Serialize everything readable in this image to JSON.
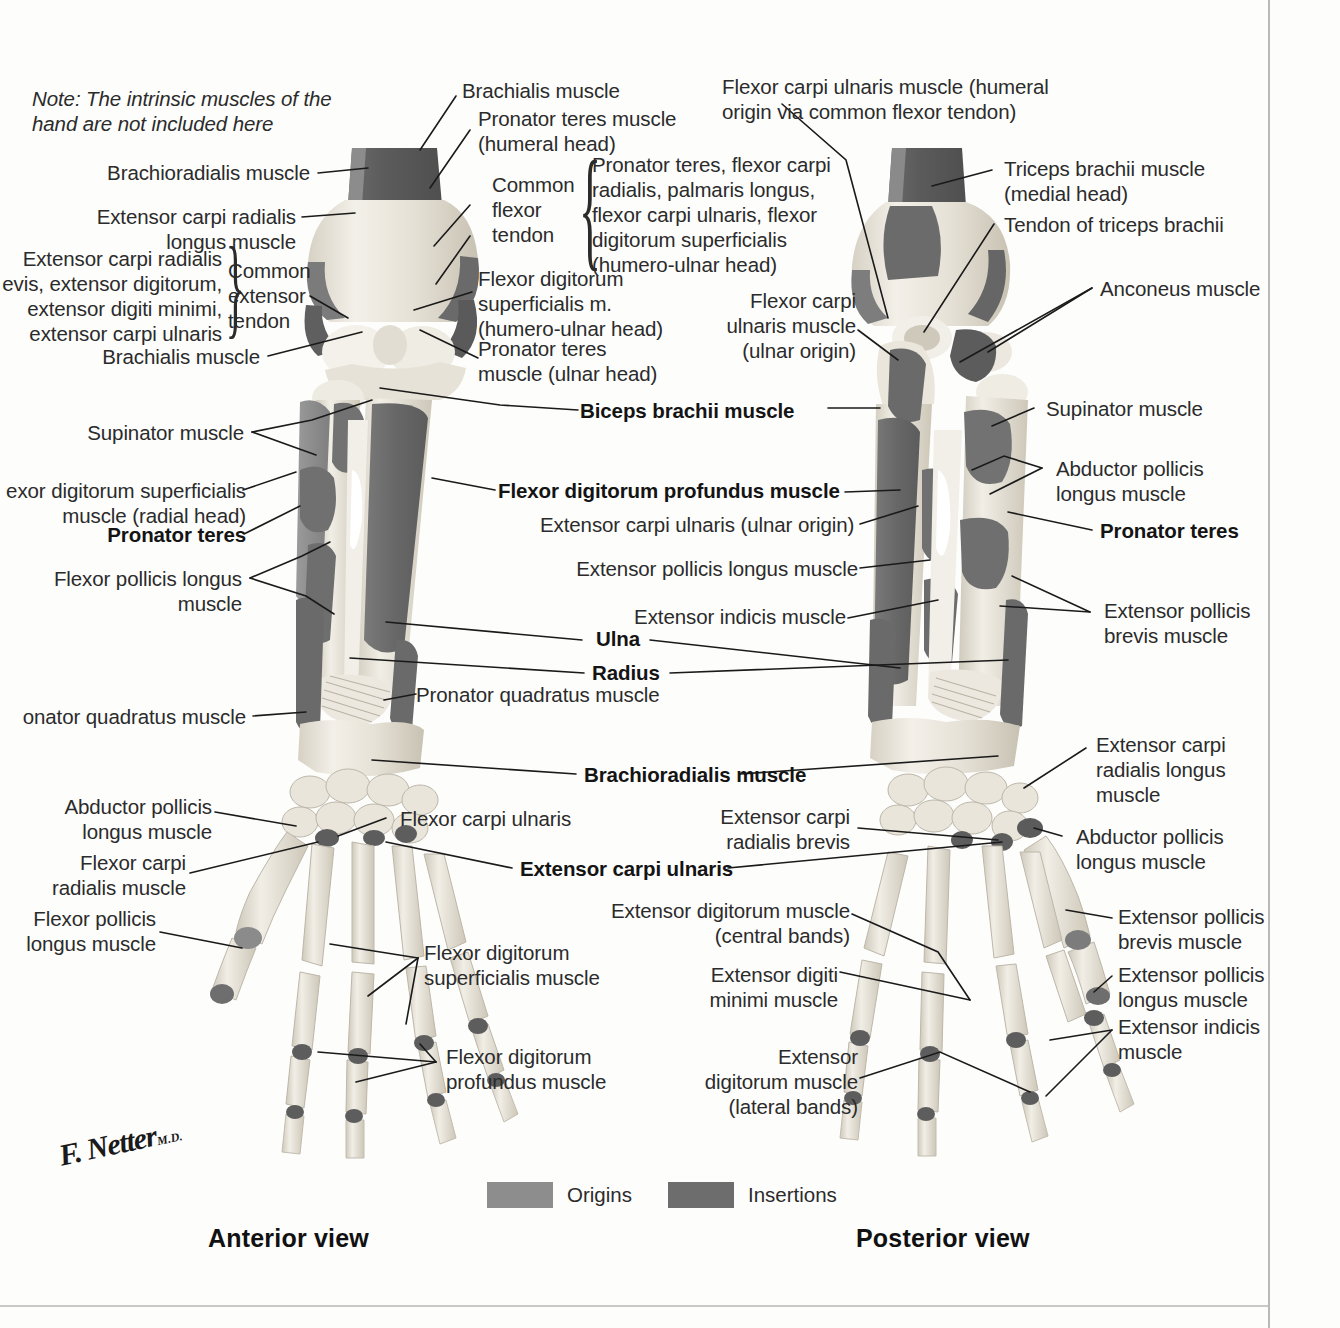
{
  "plate": {
    "note": "Note: The intrinsic muscles of the\nhand are not included here",
    "view_left": "Anterior view",
    "view_right": "Posterior view",
    "signature": "F. Netter",
    "signature_suffix": "M.D."
  },
  "legend": {
    "origins_label": "Origins",
    "insertions_label": "Insertions",
    "origins_color": "#8d8d8d",
    "insertions_color": "#6d6d6d"
  },
  "colors": {
    "bone_light": "#efece4",
    "bone_mid": "#dcd7cc",
    "bone_shadow": "#c2bcae",
    "origin_gray": "#8d8d8d",
    "insertion_gray": "#6d6d6d",
    "dark_gray": "#5d5d5d",
    "leader": "#1a1a1a",
    "page_rule": "#b9b9b9",
    "text": "#2b2b2b"
  },
  "anterior_labels": [
    {
      "id": "brachioradialis",
      "text": "Brachioradialis muscle",
      "bold": false
    },
    {
      "id": "ecrl",
      "text": "Extensor carpi radialis\nlongus muscle",
      "bold": false
    },
    {
      "id": "common-ext-group",
      "text": "Extensor carpi radialis\nevis, extensor digitorum,\nextensor digiti minimi,\nextensor carpi ulnaris",
      "bold": false
    },
    {
      "id": "common-extensor-tendon",
      "text": "Common\nextensor\ntendon",
      "bold": false
    },
    {
      "id": "brachialis-left",
      "text": "Brachialis muscle",
      "bold": false
    },
    {
      "id": "supinator-left",
      "text": "Supinator muscle",
      "bold": false
    },
    {
      "id": "fds-radial-head",
      "text": "exor digitorum superficialis\nmuscle (radial head)",
      "bold": false
    },
    {
      "id": "pronator-teres-left",
      "text": "Pronator teres",
      "bold": true
    },
    {
      "id": "fpl-left",
      "text": "Flexor pollicis longus\nmuscle",
      "bold": false
    },
    {
      "id": "pronator-quadratus-left",
      "text": "onator quadratus muscle",
      "bold": false
    },
    {
      "id": "apl-left",
      "text": "Abductor pollicis\nlongus muscle",
      "bold": false
    },
    {
      "id": "fcr-left",
      "text": "Flexor carpi\nradialis muscle",
      "bold": false
    },
    {
      "id": "fpl-hand-left",
      "text": "Flexor pollicis\nlongus muscle",
      "bold": false
    },
    {
      "id": "brachialis-top",
      "text": "Brachialis muscle",
      "bold": false
    },
    {
      "id": "pronator-teres-humeral",
      "text": "Pronator teres muscle\n(humeral head)",
      "bold": false
    },
    {
      "id": "common-flexor-tendon",
      "text": "Common\nflexor\ntendon",
      "bold": false
    },
    {
      "id": "common-flexor-group",
      "text": "Pronator teres, flexor carpi\nradialis, palmaris longus,\nflexor carpi ulnaris, flexor\ndigitorum superficialis\n(humero-ulnar head)",
      "bold": false
    },
    {
      "id": "fds-humero-ulnar",
      "text": "Flexor digitorum\nsuperficialis m.\n(humero-ulnar head)",
      "bold": false
    },
    {
      "id": "pronator-teres-ulnar",
      "text": "Pronator teres\nmuscle (ulnar head)",
      "bold": false
    },
    {
      "id": "biceps-brachii",
      "text": "Biceps brachii muscle",
      "bold": true
    },
    {
      "id": "fdp",
      "text": "Flexor digitorum profundus muscle",
      "bold": true
    },
    {
      "id": "ecu-ulnar-origin",
      "text": "Extensor carpi ulnaris (ulnar origin)",
      "bold": false
    },
    {
      "id": "epl",
      "text": "Extensor pollicis longus muscle",
      "bold": false
    },
    {
      "id": "extensor-indicis",
      "text": "Extensor indicis muscle",
      "bold": false
    },
    {
      "id": "ulna",
      "text": "Ulna",
      "bold": true
    },
    {
      "id": "radius",
      "text": "Radius",
      "bold": true
    },
    {
      "id": "pronator-quadratus-mid",
      "text": "Pronator quadratus muscle",
      "bold": false
    },
    {
      "id": "brachioradialis-mid",
      "text": "Brachioradialis muscle",
      "bold": true
    },
    {
      "id": "fcu-mid",
      "text": "Flexor carpi ulnaris",
      "bold": false
    },
    {
      "id": "ecu-mid",
      "text": "Extensor carpi ulnaris",
      "bold": true
    },
    {
      "id": "fds-hand",
      "text": "Flexor digitorum\nsuperficialis muscle",
      "bold": false
    },
    {
      "id": "fdp-hand",
      "text": "Flexor digitorum\nprofundus muscle",
      "bold": false
    }
  ],
  "posterior_labels": [
    {
      "id": "fcu-humeral-origin",
      "text": "Flexor carpi ulnaris muscle (humeral\norigin via common flexor tendon)",
      "bold": false
    },
    {
      "id": "triceps-medial",
      "text": "Triceps brachii muscle\n(medial head)",
      "bold": false
    },
    {
      "id": "triceps-tendon",
      "text": "Tendon of triceps brachii",
      "bold": false
    },
    {
      "id": "anconeus",
      "text": "Anconeus muscle",
      "bold": false
    },
    {
      "id": "fcu-ulnar-origin",
      "text": "Flexor carpi\nulnaris muscle\n(ulnar origin)",
      "bold": false
    },
    {
      "id": "supinator-right",
      "text": "Supinator muscle",
      "bold": false
    },
    {
      "id": "apl-right",
      "text": "Abductor pollicis\nlongus muscle",
      "bold": false
    },
    {
      "id": "pronator-teres-right",
      "text": "Pronator teres",
      "bold": true
    },
    {
      "id": "epb-right",
      "text": "Extensor pollicis\nbrevis muscle",
      "bold": false
    },
    {
      "id": "ecrl-right",
      "text": "Extensor carpi\nradialis longus\nmuscle",
      "bold": false
    },
    {
      "id": "apl-hand-right",
      "text": "Abductor pollicis\nlongus muscle",
      "bold": false
    },
    {
      "id": "epb-hand-right",
      "text": "Extensor pollicis\nbrevis muscle",
      "bold": false
    },
    {
      "id": "epl-hand-right",
      "text": "Extensor pollicis\nlongus muscle",
      "bold": false
    },
    {
      "id": "ei-hand-right",
      "text": "Extensor indicis\nmuscle",
      "bold": false
    },
    {
      "id": "ecrb-right",
      "text": "Extensor carpi\nradialis brevis",
      "bold": false
    },
    {
      "id": "ed-central",
      "text": "Extensor digitorum muscle\n(central bands)",
      "bold": false
    },
    {
      "id": "edm",
      "text": "Extensor digiti\nminimi muscle",
      "bold": false
    },
    {
      "id": "ed-lateral",
      "text": "Extensor\ndigitorum muscle\n(lateral bands)",
      "bold": false
    }
  ]
}
